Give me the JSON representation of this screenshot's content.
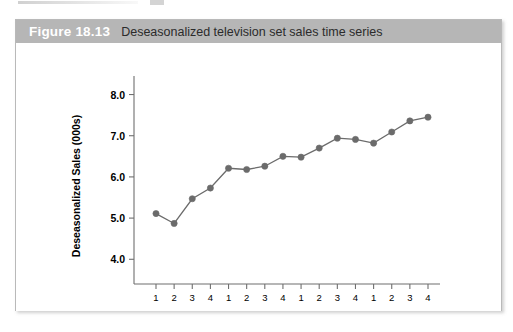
{
  "figure": {
    "number": "Figure 18.13",
    "caption": "Deseasonalized television set sales time series"
  },
  "chart_data": {
    "type": "line",
    "title": "Deseasonalized television set sales time series",
    "xlabel": "",
    "ylabel": "Deseasonalized Sales (000s)",
    "ylim": [
      3.4,
      8.45
    ],
    "yticks": [
      "4.0",
      "5.0",
      "6.0",
      "7.0",
      "8.0"
    ],
    "ytick_values": [
      4.0,
      5.0,
      6.0,
      7.0,
      8.0
    ],
    "grid": false,
    "legend": "none",
    "marker": "filled-circle",
    "series_color": "#6b6b6b",
    "categories": [
      "1",
      "2",
      "3",
      "4",
      "1",
      "2",
      "3",
      "4",
      "1",
      "2",
      "3",
      "4",
      "1",
      "2",
      "3",
      "4"
    ],
    "x": [
      1,
      2,
      3,
      4,
      5,
      6,
      7,
      8,
      9,
      10,
      11,
      12,
      13,
      14,
      15,
      16
    ],
    "values": [
      5.11,
      4.87,
      5.47,
      5.73,
      6.21,
      6.18,
      6.26,
      6.5,
      6.48,
      6.7,
      6.94,
      6.91,
      6.82,
      7.09,
      7.36,
      7.45
    ],
    "group_labels": [
      "Year 1",
      "Year 2",
      "Year 3",
      "Year 4"
    ],
    "group_size": 4
  }
}
